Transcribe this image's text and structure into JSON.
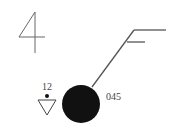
{
  "station_model": {
    "present_weather_code": "4",
    "pressure_tendency_value": "12",
    "pressure": "045",
    "cloud_cover": "overcast (filled circle)",
    "weather_symbol": "rain shower (dot over triangle)",
    "wind": {
      "barbs": [
        "full",
        "half"
      ],
      "speed_knots": "15",
      "direction": "from northeast"
    },
    "colors": {
      "ink": "#111111",
      "line": "#555555",
      "text": "#444444"
    }
  }
}
